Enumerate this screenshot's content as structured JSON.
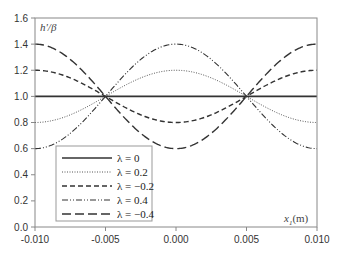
{
  "chart_data": {
    "type": "line",
    "title": "",
    "ylabel": "h'/β",
    "xlabel": "x1(m)",
    "xlim": [
      -0.01,
      0.01
    ],
    "ylim": [
      0.0,
      1.6
    ],
    "xticks": [
      "-0.010",
      "-0.005",
      "0.000",
      "0.005",
      "0.010"
    ],
    "yticks": [
      "0.0",
      "0.2",
      "0.4",
      "0.6",
      "0.8",
      "1.0",
      "1.2",
      "1.4",
      "1.6"
    ],
    "grid": false,
    "legend_position": "lower-left",
    "formula_hint": "y = 1 + λ·cos(π·x/0.01)",
    "x": [
      -0.01,
      -0.0075,
      -0.005,
      -0.0025,
      0.0,
      0.0025,
      0.005,
      0.0075,
      0.01
    ],
    "series": [
      {
        "name": "λ = 0",
        "lambda": 0,
        "style": "solid",
        "values": [
          1.0,
          1.0,
          1.0,
          1.0,
          1.0,
          1.0,
          1.0,
          1.0,
          1.0
        ]
      },
      {
        "name": "λ = 0.2",
        "lambda": 0.2,
        "style": "dotted",
        "values": [
          0.8,
          0.859,
          1.0,
          1.141,
          1.2,
          1.141,
          1.0,
          0.859,
          0.8
        ]
      },
      {
        "name": "λ = −0.2",
        "lambda": -0.2,
        "style": "dashed",
        "values": [
          1.2,
          1.141,
          1.0,
          0.859,
          0.8,
          0.859,
          1.0,
          1.141,
          1.2
        ]
      },
      {
        "name": "λ = 0.4",
        "lambda": 0.4,
        "style": "dash-dot-dot",
        "values": [
          0.6,
          0.717,
          1.0,
          1.283,
          1.4,
          1.283,
          1.0,
          0.717,
          0.6
        ]
      },
      {
        "name": "λ = −0.4",
        "lambda": -0.4,
        "style": "long-dash",
        "values": [
          1.4,
          1.283,
          1.0,
          0.717,
          0.6,
          0.717,
          1.0,
          1.283,
          1.4
        ]
      }
    ]
  },
  "axis": {
    "ylabel": "h'/β",
    "xlabel_main": "x",
    "xlabel_sub": "1",
    "xlabel_unit": "(m)"
  },
  "legend": [
    {
      "label": "λ = 0"
    },
    {
      "label": "λ = 0.2"
    },
    {
      "label": "λ = −0.2"
    },
    {
      "label": "λ = 0.4"
    },
    {
      "label": "λ = −0.4"
    }
  ]
}
